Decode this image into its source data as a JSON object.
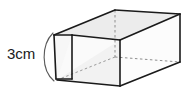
{
  "figure": {
    "shape_name": "rectangular prism",
    "projection": "oblique",
    "labels": [
      {
        "id": "height-label",
        "text": "3cm",
        "value": 3,
        "unit": "cm",
        "measures": "height",
        "position": "left"
      }
    ],
    "colors": {
      "edge": "#1a1a1a",
      "hidden_edge": "#8c8c8c",
      "top_face": "#ececec",
      "front_face": "#f4f4f4",
      "side_face": "#fbfbfb",
      "inner_face": "#f0f0f0",
      "background": "#ffffff",
      "text": "#1a1a1a",
      "brace": "#555555"
    },
    "brace": {
      "id": "height-brace",
      "shape": "arc"
    }
  }
}
